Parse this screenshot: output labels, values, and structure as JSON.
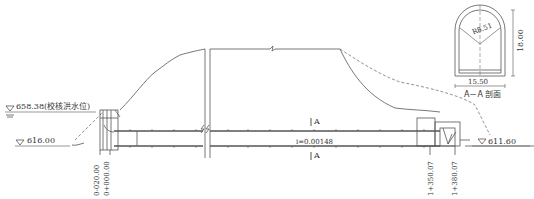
{
  "drawing": {
    "type": "tunnel longitudinal profile with cross-section",
    "elevations": {
      "check_flood_level": "658.38(校核洪水位)",
      "inlet_bed": "616.00",
      "outlet_bed": "611.60"
    },
    "slope": "i=0.00148",
    "section_marks": {
      "top": "A",
      "bottom": "A"
    },
    "stations": [
      {
        "id": "st1",
        "label": "0-020.00"
      },
      {
        "id": "st2",
        "label": "0+000.00"
      },
      {
        "id": "st3",
        "label": "1+350.07"
      },
      {
        "id": "st4",
        "label": "1+380.07"
      }
    ],
    "cross_section": {
      "title": "A－A 剖面",
      "radius": "R8.51",
      "height": "18.00",
      "width": "15.50"
    }
  },
  "colors": {
    "line": "#555555",
    "dash": "#777777",
    "text": "#333333",
    "background": "#ffffff"
  }
}
